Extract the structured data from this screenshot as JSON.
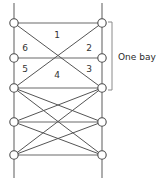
{
  "diagram": {
    "type": "truss-lattice-elevation",
    "geometry": {
      "left_chord_x": 14,
      "right_chord_x": 102,
      "node_radius": 4.2,
      "row_y": [
        23,
        58,
        88,
        122,
        155
      ],
      "stub_top_y": 3,
      "stub_bottom_y": 178
    },
    "nodes": [
      {
        "id": "L1",
        "x": 14,
        "y": 23
      },
      {
        "id": "R1",
        "x": 102,
        "y": 23
      },
      {
        "id": "L2",
        "x": 14,
        "y": 58
      },
      {
        "id": "R2",
        "x": 102,
        "y": 58
      },
      {
        "id": "L3",
        "x": 14,
        "y": 88
      },
      {
        "id": "R3",
        "x": 102,
        "y": 88
      },
      {
        "id": "L4",
        "x": 14,
        "y": 122
      },
      {
        "id": "R4",
        "x": 102,
        "y": 122
      },
      {
        "id": "L5",
        "x": 14,
        "y": 155
      },
      {
        "id": "R5",
        "x": 102,
        "y": 155
      }
    ],
    "horizontal_members": [
      {
        "y": 23,
        "x1": 14,
        "x2": 102
      },
      {
        "y": 58,
        "x1": 14,
        "x2": 102
      },
      {
        "y": 88,
        "x1": 14,
        "x2": 102
      },
      {
        "y": 122,
        "x1": 14,
        "x2": 102
      },
      {
        "y": 155,
        "x1": 14,
        "x2": 102
      }
    ],
    "chords": [
      {
        "x": 14,
        "y1": 23,
        "y2": 155
      },
      {
        "x": 102,
        "y1": 23,
        "y2": 155
      }
    ],
    "stubs": [
      {
        "x": 14,
        "y1": 3,
        "y2": 23
      },
      {
        "x": 102,
        "y1": 3,
        "y2": 23
      },
      {
        "x": 14,
        "y1": 155,
        "y2": 178
      },
      {
        "x": 102,
        "y1": 155,
        "y2": 178
      }
    ],
    "diagonal_members": [
      {
        "x1": 14,
        "y1": 23,
        "x2": 102,
        "y2": 88
      },
      {
        "x1": 102,
        "y1": 23,
        "x2": 14,
        "y2": 88
      },
      {
        "x1": 14,
        "y1": 88,
        "x2": 102,
        "y2": 122
      },
      {
        "x1": 102,
        "y1": 88,
        "x2": 14,
        "y2": 122
      },
      {
        "x1": 14,
        "y1": 122,
        "x2": 102,
        "y2": 155
      },
      {
        "x1": 102,
        "y1": 122,
        "x2": 14,
        "y2": 155
      },
      {
        "x1": 14,
        "y1": 88,
        "x2": 102,
        "y2": 155
      },
      {
        "x1": 102,
        "y1": 88,
        "x2": 14,
        "y2": 155
      }
    ],
    "member_labels": [
      {
        "id": "member-1",
        "text": "1",
        "x": 57,
        "y": 35
      },
      {
        "id": "member-2",
        "text": "2",
        "x": 89,
        "y": 48
      },
      {
        "id": "member-3",
        "text": "3",
        "x": 89,
        "y": 69
      },
      {
        "id": "member-4",
        "text": "4",
        "x": 57,
        "y": 75
      },
      {
        "id": "member-5",
        "text": "5",
        "x": 25,
        "y": 69
      },
      {
        "id": "member-6",
        "text": "6",
        "x": 25,
        "y": 48
      }
    ],
    "bay_annotation": {
      "label": "One bay",
      "label_x": 118,
      "label_y": 57,
      "bracket_x": 112,
      "bracket_top_y": 22,
      "bracket_bottom_y": 90,
      "bracket_tick": 4
    },
    "colors": {
      "line": "#555555",
      "chord": "#6a6a6a",
      "node_fill": "#ffffff",
      "node_stroke": "#4a4a4a",
      "bracket": "#8a8a8a",
      "text": "#2a2a2a",
      "background": "#ffffff"
    }
  }
}
